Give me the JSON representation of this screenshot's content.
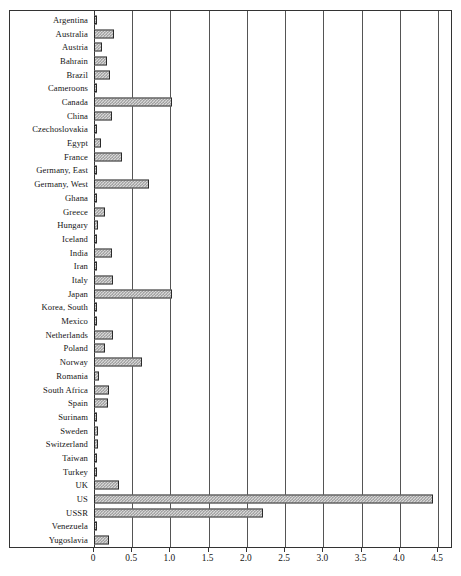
{
  "chart_data": {
    "type": "bar",
    "orientation": "horizontal",
    "title": "",
    "xlabel": "",
    "ylabel": "",
    "xlim": [
      0,
      4.5
    ],
    "xticks": [
      "0",
      "0.5",
      "1.0",
      "1.5",
      "2.0",
      "2.5",
      "3.0",
      "3.5",
      "4.0",
      "4.5"
    ],
    "xtick_values": [
      0,
      0.5,
      1.0,
      1.5,
      2.0,
      2.5,
      3.0,
      3.5,
      4.0,
      4.5
    ],
    "grid": true,
    "legend": "none",
    "categories": [
      "Argentina",
      "Australia",
      "Austria",
      "Bahrain",
      "Brazil",
      "Cameroons",
      "Canada",
      "China",
      "Czechoslovakia",
      "Egypt",
      "France",
      "Germany, East",
      "Germany, West",
      "Ghana",
      "Greece",
      "Hungary",
      "Iceland",
      "India",
      "Iran",
      "Italy",
      "Japan",
      "Korea, South",
      "Mexico",
      "Netherlands",
      "Poland",
      "Norway",
      "Romania",
      "South Africa",
      "Spain",
      "Surinam",
      "Sweden",
      "Switzerland",
      "Taiwan",
      "Turkey",
      "UK",
      "US",
      "USSR",
      "Venezuela",
      "Yugoslavia"
    ],
    "values": [
      0.02,
      0.26,
      0.1,
      0.17,
      0.21,
      0.01,
      1.02,
      0.24,
      0.02,
      0.09,
      0.37,
      0.03,
      0.72,
      0.01,
      0.15,
      0.05,
      0.04,
      0.23,
      0.01,
      0.25,
      1.02,
      0.01,
      0.02,
      0.25,
      0.14,
      0.63,
      0.06,
      0.19,
      0.18,
      0.04,
      0.05,
      0.05,
      0.02,
      0.01,
      0.33,
      4.44,
      2.21,
      0.03,
      0.19
    ],
    "bar_fill_color": "#d8d8d8",
    "bar_pattern": "checker",
    "bar_edge_color": "#2a2a2a",
    "gridline_color": "#555555",
    "axis_color": "#333333"
  }
}
